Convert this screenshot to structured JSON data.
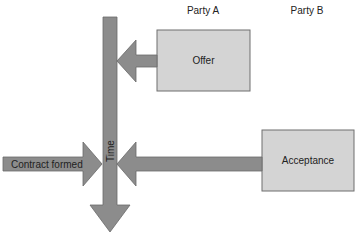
{
  "headers": {
    "party_a": "Party A",
    "party_b": "Party B"
  },
  "boxes": {
    "offer": "Offer",
    "acceptance": "Acceptance"
  },
  "arrows": {
    "time": "Time",
    "contract_formed": "Contract formed"
  },
  "colors": {
    "box_fill": "#d4d4d4",
    "arrow_fill": "#8c8c8c",
    "outline": "#6f6f6f",
    "text": "#222222"
  }
}
